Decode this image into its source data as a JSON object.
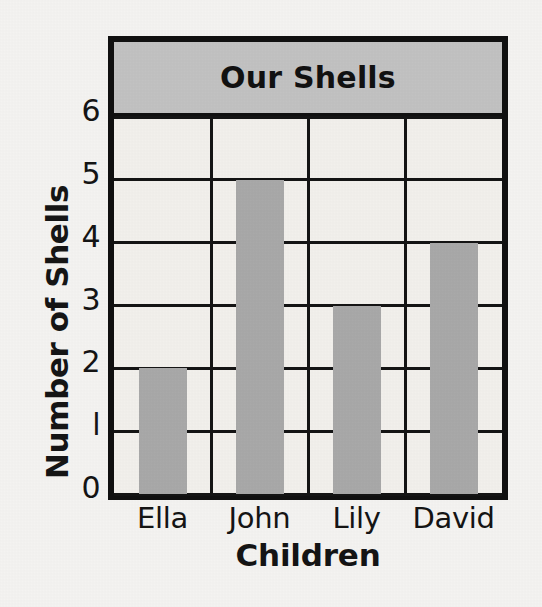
{
  "chart_data": {
    "type": "bar",
    "title": "Our Shells",
    "xlabel": "Children",
    "ylabel": "Number of Shells",
    "categories": [
      "Ella",
      "John",
      "Lily",
      "David"
    ],
    "values": [
      2,
      5,
      3,
      4
    ],
    "ylim": [
      0,
      6
    ],
    "ytick_labels": [
      "0",
      "l",
      "2",
      "3",
      "4",
      "5",
      "6"
    ],
    "ytick_values": [
      0,
      1,
      2,
      3,
      4,
      5,
      6
    ],
    "grid": true,
    "legend": "none",
    "colors": {
      "bar_fill": "#a9a9a9",
      "title_banner": "#c2c2c2",
      "plot_background": "#f2f0ec",
      "page_background": "#f4f3f1",
      "axis_line": "#101010",
      "text": "#141414"
    }
  }
}
